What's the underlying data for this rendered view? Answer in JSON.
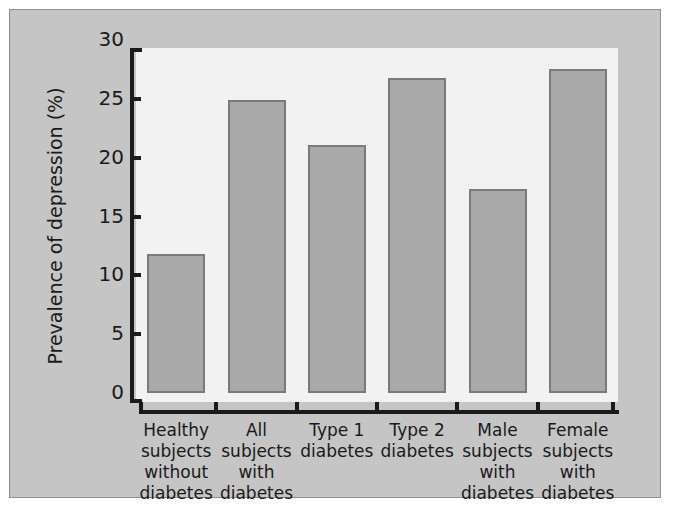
{
  "chart_data": {
    "type": "bar",
    "title": "",
    "xlabel": "",
    "ylabel": "Prevalence of depression (%)",
    "ylim": [
      0,
      30
    ],
    "yticks": [
      0,
      5,
      10,
      15,
      20,
      25,
      30
    ],
    "ytick_labels": [
      "0",
      "5",
      "10",
      "15",
      "20",
      "25",
      "30"
    ],
    "grid": false,
    "legend": null,
    "categories": [
      "Healthy subjects without diabetes",
      "All subjects with diabetes",
      "Type 1 diabetes",
      "Type 2 diabetes",
      "Male subjects with diabetes",
      "Female subjects with diabetes"
    ],
    "category_lines": [
      [
        "Healthy",
        "subjects",
        "without",
        "diabetes"
      ],
      [
        "All",
        "subjects",
        "with",
        "diabetes"
      ],
      [
        "Type 1",
        "diabetes"
      ],
      [
        "Type 2",
        "diabetes"
      ],
      [
        "Male",
        "subjects",
        "with",
        "diabetes"
      ],
      [
        "Female",
        "subjects",
        "with",
        "diabetes"
      ]
    ],
    "values": [
      11.8,
      24.9,
      21.1,
      26.8,
      17.3,
      27.5
    ],
    "colors": {
      "bar_fill": "#a9a9a9",
      "bar_edge": "#7a7a7a",
      "plot_background": "#f2f2f2",
      "panel_background": "#c5c5c5",
      "panel_border": "#8f8f8f",
      "axis": "#1a1a1a",
      "page_background": "#ffffff"
    }
  }
}
